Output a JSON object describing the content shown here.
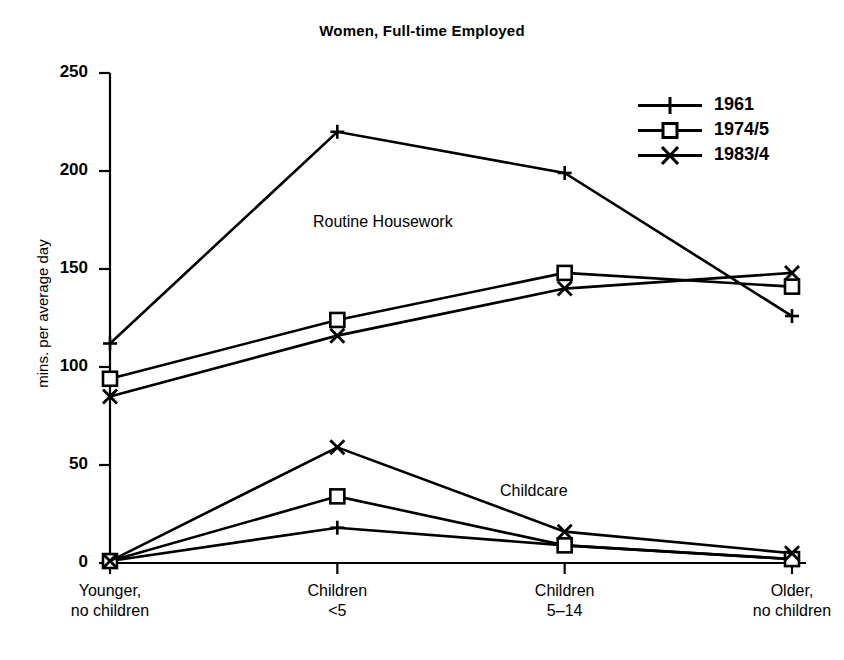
{
  "chart_data": {
    "type": "line",
    "title": "Women, Full-time Employed",
    "xlabel": "",
    "ylabel": "mins. per average day",
    "ylim": [
      0,
      250
    ],
    "yticks": [
      0,
      50,
      100,
      150,
      200,
      250
    ],
    "grid": false,
    "legend_position": "top-right",
    "categories": [
      "Younger,\nno children",
      "Children\n<5",
      "Children\n5–14",
      "Older,\nno children"
    ],
    "category_lines": [
      [
        "Younger,",
        "no children"
      ],
      [
        "Children",
        "<5"
      ],
      [
        "Children",
        "5–14"
      ],
      [
        "Older,",
        "no children"
      ]
    ],
    "groups": [
      {
        "name": "Routine Housework",
        "annotation": "Routine Housework",
        "series": [
          {
            "name": "1961",
            "marker": "plus",
            "values": [
              112,
              220,
              199,
              126
            ]
          },
          {
            "name": "1974/5",
            "marker": "square",
            "values": [
              94,
              124,
              148,
              141
            ]
          },
          {
            "name": "1983/4",
            "marker": "cross",
            "values": [
              85,
              116,
              140,
              148
            ]
          }
        ]
      },
      {
        "name": "Childcare",
        "annotation": "Childcare",
        "series": [
          {
            "name": "1961",
            "marker": "plus",
            "values": [
              1,
              18,
              9,
              2
            ]
          },
          {
            "name": "1974/5",
            "marker": "square",
            "values": [
              1,
              34,
              9,
              2
            ]
          },
          {
            "name": "1983/4",
            "marker": "cross",
            "values": [
              1,
              59,
              16,
              5
            ]
          }
        ]
      }
    ],
    "legend": [
      {
        "label": "1961",
        "marker": "plus"
      },
      {
        "label": "1974/5",
        "marker": "square"
      },
      {
        "label": "1983/4",
        "marker": "cross"
      }
    ],
    "tick_labels_y": [
      "0",
      "50",
      "100",
      "150",
      "200",
      "250"
    ]
  }
}
